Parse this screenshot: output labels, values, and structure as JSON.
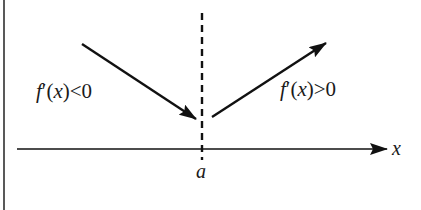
{
  "diagram": {
    "type": "derivative-sign-diagram",
    "axis_label": "x",
    "point_label": "a",
    "left_label": {
      "func": "f",
      "prime": "′",
      "arg": "(x)",
      "rel": "<0"
    },
    "right_label": {
      "func": "f",
      "prime": "′",
      "arg": "(x)",
      "rel": ">0"
    },
    "left_arrow_meaning": "decreasing",
    "right_arrow_meaning": "increasing",
    "colors": {
      "stroke": "#111111",
      "background": "#ffffff"
    }
  }
}
